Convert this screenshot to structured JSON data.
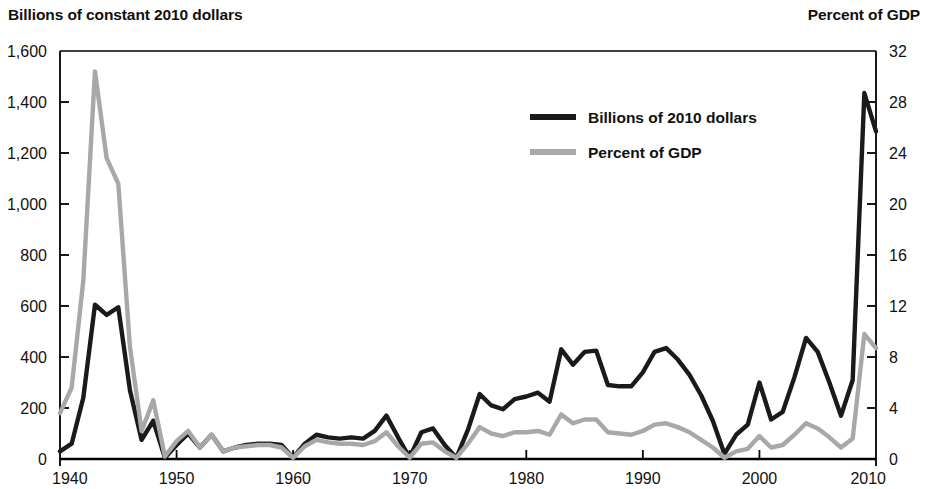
{
  "left_axis_title": "Billions of constant 2010 dollars",
  "right_axis_title": "Percent of GDP",
  "legend": {
    "series1_label": "Billions of 2010 dollars",
    "series2_label": "Percent of GDP"
  },
  "colors": {
    "series1": "#1a1a1a",
    "series2": "#a8a8a8",
    "axis": "#000000",
    "text": "#111111",
    "background": "#ffffff"
  },
  "chart_data": {
    "type": "line",
    "title": "",
    "subtitle": "",
    "xlabel": "",
    "ylabel": "Billions of constant 2010 dollars",
    "y2label": "Percent of GDP",
    "xlim": [
      1940,
      2010
    ],
    "ylim": [
      0,
      1600
    ],
    "y2lim": [
      0,
      32
    ],
    "grid": false,
    "legend_position": "upper-center",
    "xticks": [
      1940,
      1950,
      1960,
      1970,
      1980,
      1990,
      2000,
      2010
    ],
    "xtick_labels": [
      "1940",
      "1950",
      "1960",
      "1970",
      "1980",
      "1990",
      "2000",
      "2010"
    ],
    "yticks": [
      0,
      200,
      400,
      600,
      800,
      1000,
      1200,
      1400,
      1600
    ],
    "ytick_labels": [
      "0",
      "200",
      "400",
      "600",
      "800",
      "1,000",
      "1,200",
      "1,400",
      "1,600"
    ],
    "y2ticks": [
      0,
      4,
      8,
      12,
      16,
      20,
      24,
      28,
      32
    ],
    "y2tick_labels": [
      "0",
      "4",
      "8",
      "12",
      "16",
      "20",
      "24",
      "28",
      "32"
    ],
    "x": [
      1940,
      1941,
      1942,
      1943,
      1944,
      1945,
      1946,
      1947,
      1948,
      1949,
      1950,
      1951,
      1952,
      1953,
      1954,
      1955,
      1956,
      1957,
      1958,
      1959,
      1960,
      1961,
      1962,
      1963,
      1964,
      1965,
      1966,
      1967,
      1968,
      1969,
      1970,
      1971,
      1972,
      1973,
      1974,
      1975,
      1976,
      1977,
      1978,
      1979,
      1980,
      1981,
      1982,
      1983,
      1984,
      1985,
      1986,
      1987,
      1988,
      1989,
      1990,
      1991,
      1992,
      1993,
      1994,
      1995,
      1996,
      1997,
      1998,
      1999,
      2000,
      2001,
      2002,
      2003,
      2004,
      2005,
      2006,
      2007,
      2008,
      2009,
      2010
    ],
    "series": [
      {
        "name": "Billions of 2010 dollars",
        "axis": "left",
        "color": "#1a1a1a",
        "values": [
          30,
          60,
          240,
          605,
          565,
          595,
          270,
          75,
          150,
          5,
          55,
          100,
          45,
          95,
          30,
          45,
          55,
          60,
          60,
          55,
          5,
          60,
          95,
          85,
          80,
          85,
          80,
          110,
          170,
          85,
          5,
          105,
          120,
          55,
          5,
          115,
          255,
          210,
          195,
          235,
          245,
          260,
          225,
          430,
          370,
          420,
          425,
          290,
          285,
          285,
          340,
          420,
          435,
          390,
          330,
          250,
          150,
          20,
          95,
          135,
          300,
          155,
          185,
          320,
          475,
          420,
          300,
          170,
          310,
          1435,
          1285
        ]
      },
      {
        "name": "Percent of GDP",
        "axis": "right",
        "color": "#a8a8a8",
        "values": [
          3.6,
          5.6,
          14.0,
          30.4,
          23.6,
          21.6,
          8.8,
          2.2,
          4.6,
          0.2,
          1.4,
          2.2,
          0.9,
          1.9,
          0.6,
          0.9,
          1.0,
          1.1,
          1.1,
          0.9,
          0.1,
          1.0,
          1.5,
          1.3,
          1.2,
          1.2,
          1.1,
          1.4,
          2.1,
          1.0,
          0.1,
          1.2,
          1.3,
          0.6,
          0.1,
          1.2,
          2.5,
          2.0,
          1.8,
          2.1,
          2.1,
          2.2,
          1.9,
          3.5,
          2.8,
          3.1,
          3.1,
          2.1,
          2.0,
          1.9,
          2.2,
          2.7,
          2.8,
          2.5,
          2.1,
          1.5,
          0.9,
          0.1,
          0.6,
          0.8,
          1.8,
          0.9,
          1.1,
          1.9,
          2.8,
          2.4,
          1.7,
          0.9,
          1.6,
          9.8,
          8.7
        ]
      }
    ]
  },
  "geometry": {
    "plot_left": 60,
    "plot_right": 876,
    "plot_top": 51,
    "plot_bottom": 459
  }
}
